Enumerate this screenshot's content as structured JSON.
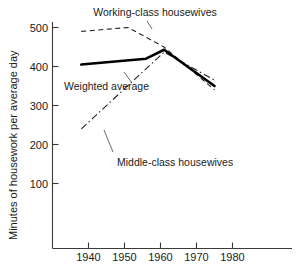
{
  "chart_data": {
    "type": "line",
    "title": "",
    "xlabel": "",
    "ylabel": "Minutes of housework per average day",
    "xlim": [
      1933,
      1985
    ],
    "ylim": [
      0,
      520
    ],
    "grid": false,
    "legend_position": "inline-annotations",
    "xticks": [
      1940,
      1950,
      1960,
      1970,
      1980
    ],
    "xtick_labels": [
      "1940",
      "1950",
      "1960",
      "1970",
      "1980"
    ],
    "yticks": [
      100,
      200,
      300,
      400,
      500
    ],
    "ytick_labels": [
      "100",
      "200",
      "300",
      "400",
      "500"
    ],
    "series": [
      {
        "name": "Working-class housewives",
        "style": "dashed",
        "color": "#222222",
        "x": [
          1938,
          1951,
          1961,
          1975
        ],
        "values": [
          490,
          500,
          450,
          340
        ]
      },
      {
        "name": "Weighted average",
        "style": "solid-thick",
        "color": "#000000",
        "x": [
          1938,
          1956,
          1961,
          1975
        ],
        "values": [
          405,
          420,
          443,
          350
        ]
      },
      {
        "name": "Middle-class housewives",
        "style": "dash-dot",
        "color": "#222222",
        "x": [
          1938,
          1961,
          1975
        ],
        "values": [
          240,
          437,
          365
        ]
      }
    ],
    "annotations": [
      {
        "text": "Working-class housewives",
        "x": 1952,
        "y": 515
      },
      {
        "text": "Weighted average",
        "x": 1941,
        "y": 383
      },
      {
        "text": "Middle-class housewives",
        "x": 1950,
        "y": 222
      }
    ]
  },
  "axes": {
    "ylabel": "Minutes of housework per average day",
    "ytick_labels": [
      "500",
      "400",
      "300",
      "200",
      "100"
    ],
    "xtick_labels": [
      "1940",
      "1950",
      "1960",
      "1970",
      "1980"
    ]
  },
  "labels": {
    "working_class": "Working-class housewives",
    "weighted_average": "Weighted average",
    "middle_class": "Middle-class housewives"
  }
}
